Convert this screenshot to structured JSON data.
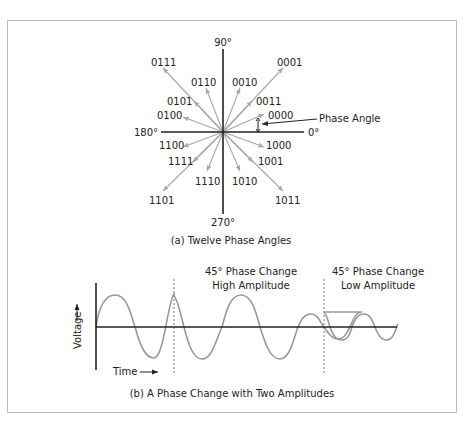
{
  "figure": {
    "panel_a": {
      "caption": "(a)  Twelve Phase Angles",
      "axis_labels": {
        "top": "90°",
        "bottom": "270°",
        "left": "180°",
        "right": "0°"
      },
      "annotation": "Phase Angle",
      "vectors": [
        {
          "code": "0000"
        },
        {
          "code": "0011"
        },
        {
          "code": "0001"
        },
        {
          "code": "0010"
        },
        {
          "code": "0110"
        },
        {
          "code": "0111"
        },
        {
          "code": "0101"
        },
        {
          "code": "0100"
        },
        {
          "code": "1100"
        },
        {
          "code": "1111"
        },
        {
          "code": "1101"
        },
        {
          "code": "1110"
        },
        {
          "code": "1010"
        },
        {
          "code": "1011"
        },
        {
          "code": "1001"
        },
        {
          "code": "1000"
        }
      ]
    },
    "panel_b": {
      "caption": "(b)  A Phase Change with Two Amplitudes",
      "y_label": "Voltage",
      "x_label": "Time",
      "annotation_1_line1": "45° Phase Change",
      "annotation_1_line2": "High Amplitude",
      "annotation_2_line1": "45° Phase Change",
      "annotation_2_line2": "Low Amplitude"
    },
    "colors": {
      "axis": "#222222",
      "vector": "#a8a8a8",
      "wave": "#999999",
      "frame": "#bdbdbd"
    }
  }
}
